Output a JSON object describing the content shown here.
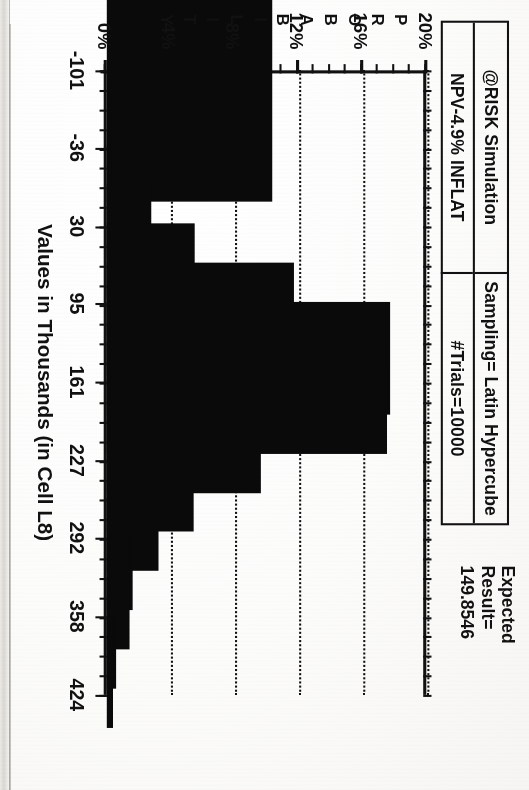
{
  "document": {
    "kind": "scanned-chart-page",
    "expected_label_line1": "Expected",
    "expected_label_line2": "Result=",
    "expected_value": "149.8546"
  },
  "title_box": {
    "cell_top_left": "@RISK Simulation",
    "cell_top_right": "Sampling= Latin Hypercube",
    "cell_bottom_left": "NPV-4.9% INFLAT",
    "cell_bottom_right": "#Trials=10000"
  },
  "axis_title_letters": [
    "P",
    "R",
    "O",
    "B",
    "A",
    "B",
    "I",
    "L",
    "I",
    "T",
    "Y"
  ],
  "chart_data": {
    "type": "bar",
    "subtitle": "Sampling= Latin Hypercube  #Trials=10000",
    "xlabel": "Values in Thousands (in Cell L8)",
    "ylabel": "PROBABILITY",
    "grid": true,
    "legend": "none",
    "xtick_labels": [
      "-101",
      "-36",
      "30",
      "95",
      "161",
      "227",
      "292",
      "358",
      "424"
    ],
    "xtick_values": [
      -101,
      -36,
      30,
      95,
      161,
      227,
      292,
      358,
      424
    ],
    "ytick_labels": [
      "0%",
      "4%",
      "8%",
      "12%",
      "16%",
      "20%"
    ],
    "ytick_values": [
      0,
      4,
      8,
      12,
      16,
      20
    ],
    "ylim": [
      0,
      20
    ],
    "xlim": [
      -101,
      424
    ],
    "ylabel_suffix": "%",
    "bin_centers": [
      -86,
      10,
      43,
      76,
      109,
      142,
      175,
      208,
      241,
      274,
      307,
      340,
      373,
      406
    ],
    "values": [
      10.3,
      0.3,
      2.8,
      5.5,
      11.7,
      17.7,
      17.5,
      9.6,
      5.4,
      3.2,
      1.6,
      1.4,
      0.6,
      0.4
    ],
    "bar_color": "#0a0a0a",
    "expected_result": 149.8546
  },
  "colors": {
    "ink": "#111111",
    "bar": "#0a0a0a",
    "paper": "#fbfbfa"
  }
}
